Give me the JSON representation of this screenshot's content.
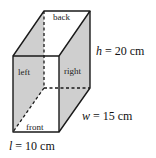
{
  "figure": {
    "type": "rectangular-prism",
    "colors": {
      "shade": "#cfcfcf",
      "edge": "#1a1a1a",
      "background": "#ffffff"
    },
    "faces": {
      "back": "back",
      "left": "left",
      "right": "right",
      "front": "front"
    },
    "dimensions": {
      "height": {
        "var": "h",
        "eq": " = 20 cm"
      },
      "width": {
        "var": "w",
        "eq": " = 15 cm"
      },
      "length": {
        "var": "l",
        "eq": " = 10 cm"
      }
    }
  }
}
